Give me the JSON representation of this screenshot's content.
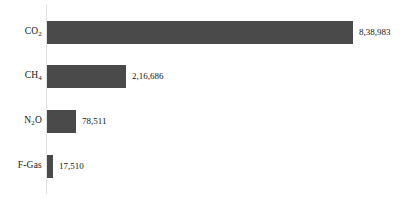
{
  "chart_data": {
    "type": "bar",
    "orientation": "horizontal",
    "title": "",
    "subtitle": "",
    "xlabel": "",
    "ylabel": "",
    "grid": false,
    "legend": false,
    "legend_position": "none",
    "axis_line": "vertical-left",
    "bar_color": "#4a4a4a",
    "background_color": "#ffffff",
    "text_color": "#141414",
    "xlim": [
      0,
      838983
    ],
    "categories": [
      "CO2",
      "CH4",
      "N2O",
      "F-Gas"
    ],
    "values": [
      838983,
      216686,
      78511,
      17510
    ],
    "bars": [
      {
        "category": "CO2",
        "label_main": "CO",
        "label_sub": "2",
        "label_suffix": "",
        "value": 838983,
        "value_label": "8,38,983"
      },
      {
        "category": "CH4",
        "label_main": "CH",
        "label_sub": "4",
        "label_suffix": "",
        "value": 216686,
        "value_label": "2,16,686"
      },
      {
        "category": "N2O",
        "label_main": "N",
        "label_sub": "2",
        "label_suffix": "O",
        "value": 78511,
        "value_label": "78,511"
      },
      {
        "category": "F-Gas",
        "label_main": "F-Gas",
        "label_sub": "",
        "label_suffix": "",
        "value": 17510,
        "value_label": "17,510"
      }
    ]
  }
}
